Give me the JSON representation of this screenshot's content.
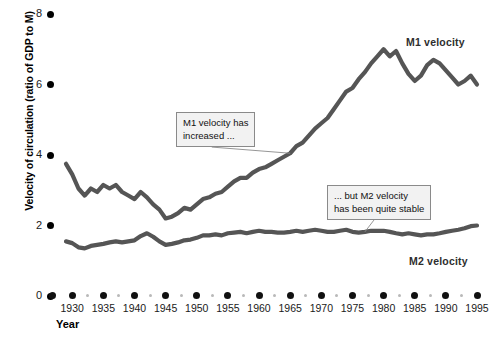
{
  "chart_data": {
    "type": "line",
    "title": "",
    "xlabel": "Year",
    "ylabel": "Velocity of circulation (ratio of GDP to M)",
    "xlim": [
      1929,
      1995
    ],
    "ylim": [
      0,
      8
    ],
    "grid": false,
    "legend": "inline-series-labels",
    "ytick_labels": [
      "0",
      "2",
      "4",
      "6",
      "8"
    ],
    "ytick_values": [
      0,
      2,
      4,
      6,
      8
    ],
    "xtick_labels": [
      "1930",
      "1935",
      "1940",
      "1945",
      "1950",
      "1955",
      "1960",
      "1965",
      "1970",
      "1975",
      "1980",
      "1985",
      "1990",
      "1995"
    ],
    "xtick_values": [
      1930,
      1935,
      1940,
      1945,
      1950,
      1955,
      1960,
      1965,
      1970,
      1975,
      1980,
      1985,
      1990,
      1995
    ],
    "x": [
      1929,
      1930,
      1931,
      1932,
      1933,
      1934,
      1935,
      1936,
      1937,
      1938,
      1939,
      1940,
      1941,
      1942,
      1943,
      1944,
      1945,
      1946,
      1947,
      1948,
      1949,
      1950,
      1951,
      1952,
      1953,
      1954,
      1955,
      1956,
      1957,
      1958,
      1959,
      1960,
      1961,
      1962,
      1963,
      1964,
      1965,
      1966,
      1967,
      1968,
      1969,
      1970,
      1971,
      1972,
      1973,
      1974,
      1975,
      1976,
      1977,
      1978,
      1979,
      1980,
      1981,
      1982,
      1983,
      1984,
      1985,
      1986,
      1987,
      1988,
      1989,
      1990,
      1991,
      1992,
      1993,
      1994,
      1995
    ],
    "series": [
      {
        "name": "M1 velocity",
        "color": "#555555",
        "values": [
          3.75,
          3.45,
          3.05,
          2.85,
          3.05,
          2.95,
          3.15,
          3.05,
          3.15,
          2.95,
          2.85,
          2.75,
          2.95,
          2.8,
          2.6,
          2.45,
          2.2,
          2.25,
          2.35,
          2.5,
          2.45,
          2.6,
          2.75,
          2.8,
          2.9,
          2.95,
          3.1,
          3.25,
          3.35,
          3.35,
          3.5,
          3.6,
          3.65,
          3.75,
          3.85,
          3.95,
          4.05,
          4.25,
          4.35,
          4.55,
          4.75,
          4.9,
          5.05,
          5.3,
          5.55,
          5.8,
          5.9,
          6.15,
          6.35,
          6.6,
          6.8,
          7.0,
          6.8,
          6.95,
          6.6,
          6.3,
          6.1,
          6.25,
          6.55,
          6.7,
          6.6,
          6.4,
          6.2,
          6.0,
          6.1,
          6.25,
          6.0
        ]
      },
      {
        "name": "M2 velocity",
        "color": "#555555",
        "values": [
          1.55,
          1.5,
          1.38,
          1.35,
          1.42,
          1.45,
          1.48,
          1.52,
          1.55,
          1.52,
          1.55,
          1.58,
          1.7,
          1.78,
          1.68,
          1.55,
          1.45,
          1.48,
          1.52,
          1.58,
          1.6,
          1.65,
          1.72,
          1.72,
          1.75,
          1.72,
          1.78,
          1.8,
          1.82,
          1.78,
          1.82,
          1.85,
          1.82,
          1.82,
          1.8,
          1.8,
          1.82,
          1.85,
          1.82,
          1.85,
          1.88,
          1.85,
          1.82,
          1.82,
          1.85,
          1.88,
          1.82,
          1.8,
          1.82,
          1.85,
          1.85,
          1.85,
          1.82,
          1.78,
          1.75,
          1.78,
          1.75,
          1.72,
          1.75,
          1.75,
          1.78,
          1.82,
          1.85,
          1.88,
          1.92,
          1.98,
          2.0
        ]
      }
    ],
    "annotations": [
      {
        "id": "m1-callout",
        "text": "M1 velocity has\nincreased ...",
        "points_to_year": 1965
      },
      {
        "id": "m2-callout",
        "text": "... but M2 velocity\nhas been quite stable",
        "points_to_year": 1977
      }
    ],
    "series_labels": [
      {
        "name": "m1-velocity-label",
        "text": "M1 velocity"
      },
      {
        "name": "m2-velocity-label",
        "text": "M2 velocity"
      }
    ]
  }
}
